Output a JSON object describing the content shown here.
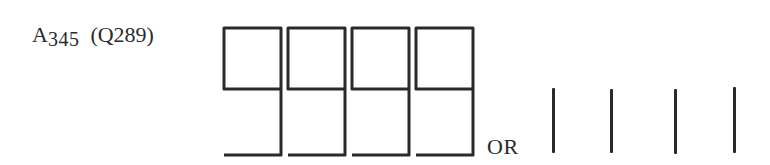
{
  "label": {
    "letter": "A",
    "number": "345",
    "paren": "(Q289)"
  },
  "glyph_style": {
    "stroke_color": "#2a2a2a",
    "stroke_width": 3
  },
  "nine_glyphs": [
    {
      "x": 223,
      "digit": "9"
    },
    {
      "x": 287,
      "digit": "9"
    },
    {
      "x": 351,
      "digit": "9"
    },
    {
      "x": 415,
      "digit": "9"
    }
  ],
  "separator_text": "OR",
  "bars": [
    {
      "x": 552,
      "top": 88,
      "height": 65
    },
    {
      "x": 610,
      "top": 89,
      "height": 64
    },
    {
      "x": 674,
      "top": 89,
      "height": 65
    },
    {
      "x": 733,
      "top": 87,
      "height": 66
    }
  ]
}
